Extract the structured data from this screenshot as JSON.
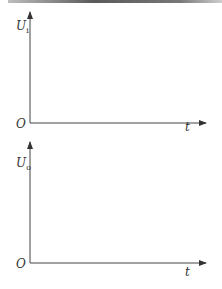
{
  "diagram": {
    "plots": [
      {
        "id": "input",
        "y_label": "U",
        "y_label_sub": "i",
        "x_label": "t",
        "origin_label": "O"
      },
      {
        "id": "output",
        "y_label": "U",
        "y_label_sub": "o",
        "x_label": "t",
        "origin_label": "O"
      }
    ],
    "colors": {
      "axis": "#444444",
      "text": "#333333"
    }
  }
}
